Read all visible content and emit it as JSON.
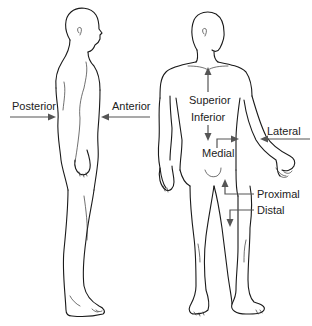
{
  "diagram": {
    "figures": [
      {
        "id": "side-view",
        "description": "Standing human figure, lateral (side) view, facing right"
      },
      {
        "id": "front-view",
        "description": "Standing human figure, anterior (front) view, head turned"
      }
    ],
    "labels": {
      "posterior": "Posterior",
      "anterior": "Anterior",
      "superior": "Superior",
      "inferior": "Inferior",
      "medial": "Medial",
      "lateral": "Lateral",
      "proximal": "Proximal",
      "distal": "Distal"
    },
    "arrows": [
      {
        "label": "Posterior",
        "direction": "right",
        "target": "back of side figure"
      },
      {
        "label": "Anterior",
        "direction": "left",
        "target": "front of side figure"
      },
      {
        "label": "Superior",
        "direction": "up",
        "target": "upper chest of front figure"
      },
      {
        "label": "Inferior",
        "direction": "down",
        "target": "abdomen of front figure"
      },
      {
        "label": "Medial",
        "direction": "right",
        "target": "inner arm of front figure"
      },
      {
        "label": "Lateral",
        "direction": "left",
        "target": "outer arm of front figure"
      },
      {
        "label": "Proximal",
        "direction": "up",
        "target": "upper thigh of front figure"
      },
      {
        "label": "Distal",
        "direction": "down",
        "target": "lower thigh of front figure"
      }
    ],
    "colors": {
      "line": "#1a1a1a",
      "arrow": "#555555",
      "text": "#222222",
      "background": "#ffffff"
    }
  }
}
